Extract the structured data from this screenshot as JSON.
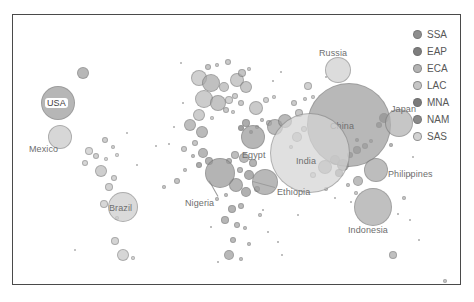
{
  "chart_data": {
    "type": "scatter",
    "title": "",
    "subtitle": "",
    "xlabel": "",
    "ylabel": "",
    "grid": false,
    "legend_position": "right",
    "size_encoding": "population",
    "color_encoding": "World Bank region",
    "legend": {
      "entries": [
        {
          "code": "SSA",
          "color": "#8e8e8e"
        },
        {
          "code": "EAP",
          "color": "#7d7d7d"
        },
        {
          "code": "ECA",
          "color": "#b3b3b3"
        },
        {
          "code": "LAC",
          "color": "#c6c6c6"
        },
        {
          "code": "MNA",
          "color": "#7a7a7a"
        },
        {
          "code": "NAM",
          "color": "#8a8a8a"
        },
        {
          "code": "SAS",
          "color": "#d2d2d2"
        }
      ]
    },
    "labeled_points": [
      {
        "name": "USA",
        "region": "NAM",
        "x": 45,
        "y": 88,
        "r": 17,
        "color": "#9b9b9b",
        "label_x": 32,
        "label_y": 83,
        "style": "boxed"
      },
      {
        "name": "Mexico",
        "region": "LAC",
        "x": 47,
        "y": 122,
        "r": 12,
        "color": "#c9c9c9",
        "label_x": 16,
        "label_y": 129,
        "style": "plain"
      },
      {
        "name": "Brazil",
        "region": "LAC",
        "x": 110,
        "y": 192,
        "r": 15,
        "color": "#cccccc",
        "label_x": 96,
        "label_y": 188,
        "style": "plain"
      },
      {
        "name": "Russia",
        "region": "ECA",
        "x": 325,
        "y": 55,
        "r": 13,
        "color": "#cfcfcf",
        "label_x": 306,
        "label_y": 33,
        "style": "plain"
      },
      {
        "name": "China",
        "region": "EAP",
        "x": 336,
        "y": 110,
        "r": 42,
        "color": "#9d9d9d",
        "label_x": 317,
        "label_y": 106,
        "style": "plain"
      },
      {
        "name": "India",
        "region": "SAS",
        "x": 297,
        "y": 138,
        "r": 40,
        "color": "#d5d5d5",
        "label_x": 283,
        "label_y": 141,
        "style": "plain"
      },
      {
        "name": "Japan",
        "region": "EAP",
        "x": 386,
        "y": 108,
        "r": 14,
        "color": "#b1b1b1",
        "label_x": 378,
        "label_y": 89,
        "style": "plain"
      },
      {
        "name": "Philippines",
        "region": "EAP",
        "x": 363,
        "y": 155,
        "r": 12,
        "color": "#a5a5a5",
        "label_x": 375,
        "label_y": 154,
        "style": "plain"
      },
      {
        "name": "Indonesia",
        "region": "EAP",
        "x": 360,
        "y": 192,
        "r": 19,
        "color": "#a8a8a8",
        "label_x": 335,
        "label_y": 210,
        "style": "plain"
      },
      {
        "name": "Egypt",
        "region": "MNA",
        "x": 240,
        "y": 122,
        "r": 12,
        "color": "#9a9a9a",
        "label_x": 229,
        "label_y": 135,
        "style": "plain"
      },
      {
        "name": "Nigeria",
        "region": "SSA",
        "x": 207,
        "y": 158,
        "r": 15,
        "color": "#989898",
        "label_x": 172,
        "label_y": 183,
        "style": "plain"
      },
      {
        "name": "Ethiopia",
        "region": "SSA",
        "x": 252,
        "y": 167,
        "r": 13,
        "color": "#9e9e9e",
        "label_x": 264,
        "label_y": 172,
        "style": "plain"
      }
    ],
    "leader_lines": [
      {
        "from_x": 205,
        "from_y": 181,
        "to_x": 196,
        "to_y": 165
      },
      {
        "from_x": 262,
        "from_y": 172,
        "to_x": 240,
        "to_y": 166
      }
    ],
    "unlabeled_points": [
      {
        "x": 70,
        "y": 58,
        "r": 6,
        "color": "#9c9c9c"
      },
      {
        "x": 92,
        "y": 125,
        "r": 3,
        "color": "#bdbdbd"
      },
      {
        "x": 100,
        "y": 132,
        "r": 2,
        "color": "#c3c3c3"
      },
      {
        "x": 76,
        "y": 136,
        "r": 4,
        "color": "#cacaca"
      },
      {
        "x": 83,
        "y": 141,
        "r": 3,
        "color": "#c0c0c0"
      },
      {
        "x": 93,
        "y": 144,
        "r": 2,
        "color": "#cdcdcd"
      },
      {
        "x": 72,
        "y": 148,
        "r": 3,
        "color": "#c8c8c8"
      },
      {
        "x": 104,
        "y": 140,
        "r": 2,
        "color": "#d0d0d0"
      },
      {
        "x": 88,
        "y": 156,
        "r": 6,
        "color": "#bcbcbc"
      },
      {
        "x": 101,
        "y": 163,
        "r": 3,
        "color": "#c6c6c6"
      },
      {
        "x": 96,
        "y": 172,
        "r": 4,
        "color": "#c2c2c2"
      },
      {
        "x": 91,
        "y": 189,
        "r": 4,
        "color": "#c9c9c9"
      },
      {
        "x": 104,
        "y": 203,
        "r": 2,
        "color": "#cfcfcf"
      },
      {
        "x": 102,
        "y": 226,
        "r": 4,
        "color": "#c4c4c4"
      },
      {
        "x": 110,
        "y": 240,
        "r": 6,
        "color": "#c7c7c7"
      },
      {
        "x": 120,
        "y": 243,
        "r": 2,
        "color": "#cccccc"
      },
      {
        "x": 62,
        "y": 235,
        "r": 1,
        "color": "#d4d4d4"
      },
      {
        "x": 124,
        "y": 150,
        "r": 1,
        "color": "#cfcfcf"
      },
      {
        "x": 114,
        "y": 118,
        "r": 1,
        "color": "#d0d0d0"
      },
      {
        "x": 168,
        "y": 48,
        "r": 1,
        "color": "#cfcfcf"
      },
      {
        "x": 195,
        "y": 52,
        "r": 3,
        "color": "#b0b0b0"
      },
      {
        "x": 204,
        "y": 50,
        "r": 2,
        "color": "#bbbbbb"
      },
      {
        "x": 215,
        "y": 47,
        "r": 3,
        "color": "#b6b6b6"
      },
      {
        "x": 186,
        "y": 63,
        "r": 8,
        "color": "#bfbfbf"
      },
      {
        "x": 198,
        "y": 68,
        "r": 9,
        "color": "#a9a9a9"
      },
      {
        "x": 211,
        "y": 72,
        "r": 5,
        "color": "#b4b4b4"
      },
      {
        "x": 224,
        "y": 65,
        "r": 7,
        "color": "#b8b8b8"
      },
      {
        "x": 233,
        "y": 72,
        "r": 6,
        "color": "#b2b2b2"
      },
      {
        "x": 191,
        "y": 84,
        "r": 9,
        "color": "#b9b9b9"
      },
      {
        "x": 205,
        "y": 88,
        "r": 8,
        "color": "#aeaeae"
      },
      {
        "x": 216,
        "y": 85,
        "r": 4,
        "color": "#c1c1c1"
      },
      {
        "x": 222,
        "y": 81,
        "r": 3,
        "color": "#bcbcbc"
      },
      {
        "x": 228,
        "y": 88,
        "r": 3,
        "color": "#b5b5b5"
      },
      {
        "x": 213,
        "y": 95,
        "r": 3,
        "color": "#b3b3b3"
      },
      {
        "x": 220,
        "y": 97,
        "r": 2,
        "color": "#bebebe"
      },
      {
        "x": 186,
        "y": 100,
        "r": 6,
        "color": "#bababa"
      },
      {
        "x": 199,
        "y": 103,
        "r": 2,
        "color": "#c2c2c2"
      },
      {
        "x": 229,
        "y": 58,
        "r": 4,
        "color": "#aeaeae"
      },
      {
        "x": 236,
        "y": 54,
        "r": 2,
        "color": "#bcbcbc"
      },
      {
        "x": 243,
        "y": 93,
        "r": 7,
        "color": "#b7b7b7"
      },
      {
        "x": 253,
        "y": 85,
        "r": 3,
        "color": "#c0c0c0"
      },
      {
        "x": 261,
        "y": 82,
        "r": 2,
        "color": "#c4c4c4"
      },
      {
        "x": 249,
        "y": 105,
        "r": 2,
        "color": "#b0b0b0"
      },
      {
        "x": 256,
        "y": 108,
        "r": 3,
        "color": "#a8a8a8"
      },
      {
        "x": 244,
        "y": 112,
        "r": 2,
        "color": "#b6b6b6"
      },
      {
        "x": 233,
        "y": 108,
        "r": 4,
        "color": "#8e8e8e"
      },
      {
        "x": 228,
        "y": 113,
        "r": 3,
        "color": "#7f7f7f"
      },
      {
        "x": 238,
        "y": 117,
        "r": 2,
        "color": "#909090"
      },
      {
        "x": 262,
        "y": 112,
        "r": 8,
        "color": "#a2a2a2"
      },
      {
        "x": 272,
        "y": 106,
        "r": 7,
        "color": "#9f9f9f"
      },
      {
        "x": 286,
        "y": 98,
        "r": 4,
        "color": "#b4b4b4"
      },
      {
        "x": 281,
        "y": 88,
        "r": 3,
        "color": "#b8b8b8"
      },
      {
        "x": 292,
        "y": 84,
        "r": 2,
        "color": "#bdbdbd"
      },
      {
        "x": 300,
        "y": 82,
        "r": 2,
        "color": "#c1c1c1"
      },
      {
        "x": 295,
        "y": 71,
        "r": 4,
        "color": "#bfbfbf"
      },
      {
        "x": 313,
        "y": 62,
        "r": 1,
        "color": "#c9c9c9"
      },
      {
        "x": 177,
        "y": 110,
        "r": 6,
        "color": "#a6a6a6"
      },
      {
        "x": 189,
        "y": 117,
        "r": 6,
        "color": "#a0a0a0"
      },
      {
        "x": 182,
        "y": 128,
        "r": 3,
        "color": "#b2b2b2"
      },
      {
        "x": 171,
        "y": 134,
        "r": 3,
        "color": "#b9b9b9"
      },
      {
        "x": 180,
        "y": 141,
        "r": 2,
        "color": "#aaaaaa"
      },
      {
        "x": 190,
        "y": 138,
        "r": 5,
        "color": "#9c9c9c"
      },
      {
        "x": 196,
        "y": 146,
        "r": 4,
        "color": "#949494"
      },
      {
        "x": 186,
        "y": 150,
        "r": 3,
        "color": "#8d8d8d"
      },
      {
        "x": 216,
        "y": 146,
        "r": 3,
        "color": "#9a9a9a"
      },
      {
        "x": 222,
        "y": 140,
        "r": 4,
        "color": "#a4a4a4"
      },
      {
        "x": 231,
        "y": 143,
        "r": 5,
        "color": "#9e9e9e"
      },
      {
        "x": 240,
        "y": 148,
        "r": 4,
        "color": "#969696"
      },
      {
        "x": 227,
        "y": 155,
        "r": 3,
        "color": "#a1a1a1"
      },
      {
        "x": 236,
        "y": 160,
        "r": 5,
        "color": "#8f8f8f"
      },
      {
        "x": 223,
        "y": 170,
        "r": 7,
        "color": "#999999"
      },
      {
        "x": 233,
        "y": 177,
        "r": 5,
        "color": "#929292"
      },
      {
        "x": 244,
        "y": 174,
        "r": 3,
        "color": "#a3a3a3"
      },
      {
        "x": 213,
        "y": 180,
        "r": 2,
        "color": "#aaaaaa"
      },
      {
        "x": 204,
        "y": 184,
        "r": 2,
        "color": "#b0b0b0"
      },
      {
        "x": 219,
        "y": 194,
        "r": 4,
        "color": "#969696"
      },
      {
        "x": 228,
        "y": 191,
        "r": 3,
        "color": "#a0a0a0"
      },
      {
        "x": 212,
        "y": 205,
        "r": 4,
        "color": "#9b9b9b"
      },
      {
        "x": 224,
        "y": 210,
        "r": 3,
        "color": "#a5a5a5"
      },
      {
        "x": 232,
        "y": 213,
        "r": 2,
        "color": "#aeaeae"
      },
      {
        "x": 220,
        "y": 225,
        "r": 3,
        "color": "#a2a2a2"
      },
      {
        "x": 236,
        "y": 229,
        "r": 2,
        "color": "#adadad"
      },
      {
        "x": 216,
        "y": 240,
        "r": 5,
        "color": "#9d9d9d"
      },
      {
        "x": 228,
        "y": 244,
        "r": 2,
        "color": "#b1b1b1"
      },
      {
        "x": 205,
        "y": 247,
        "r": 1,
        "color": "#bcbcbc"
      },
      {
        "x": 247,
        "y": 200,
        "r": 2,
        "color": "#b4b4b4"
      },
      {
        "x": 255,
        "y": 217,
        "r": 1,
        "color": "#bdbdbd"
      },
      {
        "x": 265,
        "y": 227,
        "r": 1,
        "color": "#c2c2c2"
      },
      {
        "x": 198,
        "y": 212,
        "r": 1,
        "color": "#c0c0c0"
      },
      {
        "x": 156,
        "y": 129,
        "r": 1,
        "color": "#c4c4c4"
      },
      {
        "x": 151,
        "y": 172,
        "r": 2,
        "color": "#b7b7b7"
      },
      {
        "x": 164,
        "y": 166,
        "r": 3,
        "color": "#aeaeae"
      },
      {
        "x": 172,
        "y": 155,
        "r": 2,
        "color": "#b3b3b3"
      },
      {
        "x": 284,
        "y": 122,
        "r": 5,
        "color": "#b8b8b8"
      },
      {
        "x": 291,
        "y": 114,
        "r": 3,
        "color": "#c0c0c0"
      },
      {
        "x": 278,
        "y": 132,
        "r": 2,
        "color": "#bbbbbb"
      },
      {
        "x": 300,
        "y": 160,
        "r": 3,
        "color": "#c6c6c6"
      },
      {
        "x": 312,
        "y": 152,
        "r": 7,
        "color": "#a7a7a7"
      },
      {
        "x": 322,
        "y": 145,
        "r": 5,
        "color": "#999999"
      },
      {
        "x": 330,
        "y": 150,
        "r": 6,
        "color": "#8c8c8c"
      },
      {
        "x": 326,
        "y": 158,
        "r": 4,
        "color": "#8a8a8a"
      },
      {
        "x": 337,
        "y": 140,
        "r": 3,
        "color": "#919191"
      },
      {
        "x": 344,
        "y": 135,
        "r": 4,
        "color": "#8d8d8d"
      },
      {
        "x": 352,
        "y": 131,
        "r": 3,
        "color": "#9b9b9b"
      },
      {
        "x": 358,
        "y": 126,
        "r": 2,
        "color": "#a6a6a6"
      },
      {
        "x": 344,
        "y": 125,
        "r": 2,
        "color": "#8f8f8f"
      },
      {
        "x": 371,
        "y": 103,
        "r": 5,
        "color": "#7c7c7c"
      },
      {
        "x": 366,
        "y": 110,
        "r": 3,
        "color": "#868686"
      },
      {
        "x": 378,
        "y": 130,
        "r": 2,
        "color": "#a0a0a0"
      },
      {
        "x": 335,
        "y": 170,
        "r": 2,
        "color": "#b2b2b2"
      },
      {
        "x": 343,
        "y": 178,
        "r": 2,
        "color": "#bcbcbc"
      },
      {
        "x": 345,
        "y": 166,
        "r": 5,
        "color": "#a4a4a4"
      },
      {
        "x": 338,
        "y": 187,
        "r": 1,
        "color": "#c4c4c4"
      },
      {
        "x": 313,
        "y": 174,
        "r": 2,
        "color": "#bfbfbf"
      },
      {
        "x": 322,
        "y": 183,
        "r": 1,
        "color": "#c7c7c7"
      },
      {
        "x": 391,
        "y": 183,
        "r": 2,
        "color": "#b5b5b5"
      },
      {
        "x": 385,
        "y": 199,
        "r": 1,
        "color": "#c2c2c2"
      },
      {
        "x": 397,
        "y": 160,
        "r": 1,
        "color": "#c8c8c8"
      },
      {
        "x": 400,
        "y": 142,
        "r": 1,
        "color": "#cbcbcb"
      },
      {
        "x": 380,
        "y": 240,
        "r": 4,
        "color": "#a8a8a8"
      },
      {
        "x": 397,
        "y": 205,
        "r": 1,
        "color": "#c5c5c5"
      },
      {
        "x": 406,
        "y": 225,
        "r": 1,
        "color": "#cacaca"
      },
      {
        "x": 432,
        "y": 266,
        "r": 2,
        "color": "#b4b4b4"
      },
      {
        "x": 143,
        "y": 131,
        "r": 1,
        "color": "#c8c8c8"
      },
      {
        "x": 260,
        "y": 66,
        "r": 1,
        "color": "#c3c3c3"
      },
      {
        "x": 268,
        "y": 57,
        "r": 1,
        "color": "#c7c7c7"
      },
      {
        "x": 250,
        "y": 195,
        "r": 1,
        "color": "#bfbfbf"
      },
      {
        "x": 170,
        "y": 88,
        "r": 1,
        "color": "#c6c6c6"
      },
      {
        "x": 161,
        "y": 112,
        "r": 1,
        "color": "#cacaca"
      },
      {
        "x": 285,
        "y": 200,
        "r": 1,
        "color": "#c9c9c9"
      },
      {
        "x": 269,
        "y": 240,
        "r": 1,
        "color": "#cdcdcd"
      }
    ]
  }
}
